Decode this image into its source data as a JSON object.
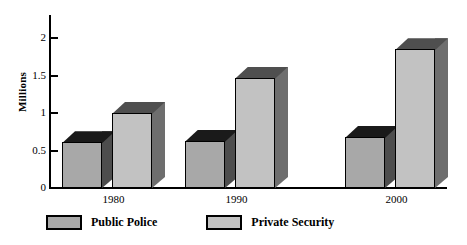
{
  "chart_data": {
    "type": "bar",
    "title": "",
    "xlabel": "",
    "ylabel": "Millions",
    "categories": [
      "1980",
      "1990",
      "2000"
    ],
    "series": [
      {
        "name": "Public Police",
        "values": [
          0.61,
          0.63,
          0.68
        ],
        "color": "#a8a8a8"
      },
      {
        "name": "Private Security",
        "values": [
          1.0,
          1.47,
          1.85
        ],
        "color": "#c2c2c2"
      }
    ],
    "ylim": [
      0,
      2.2
    ],
    "yticks": [
      0,
      0.5,
      1,
      1.5,
      2
    ],
    "ytick_labels": [
      "0",
      "0.5",
      "1",
      "1.5",
      "2"
    ],
    "grid": false,
    "legend_position": "bottom-left",
    "style": "3d-extruded-bars"
  },
  "axis": {
    "y_title": "Millions",
    "ticks": [
      {
        "label": "2"
      },
      {
        "label": "1.5"
      },
      {
        "label": "1"
      },
      {
        "label": "0.5"
      },
      {
        "label": "0"
      }
    ]
  },
  "categories": [
    {
      "label": "1980"
    },
    {
      "label": "1990"
    },
    {
      "label": "2000"
    }
  ],
  "legend": {
    "entries": [
      {
        "label": "Public Police"
      },
      {
        "label": "Private Security"
      }
    ]
  },
  "colors": {
    "public_police_front": "#a8a8a8",
    "public_police_top": "#1a1a1a",
    "public_police_side": "#4d4d4d",
    "private_security_front": "#c2c2c2",
    "private_security_top": "#4f4f4f",
    "private_security_side": "#6e6e6e",
    "axis": "#000000",
    "background": "#ffffff"
  }
}
